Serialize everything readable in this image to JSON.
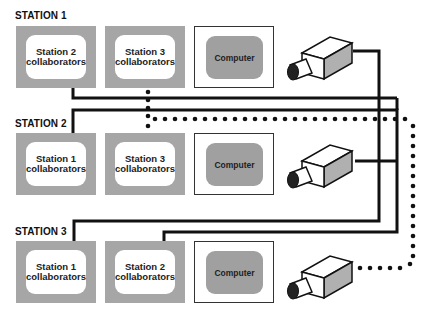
{
  "stations": [
    {
      "label": "STATION 1",
      "panels": [
        {
          "line1": "Station 2",
          "line2": "collaborators"
        },
        {
          "line1": "Station 3",
          "line2": "collaborators"
        }
      ],
      "computer": "Computer",
      "camera": "camera-icon"
    },
    {
      "label": "STATION 2",
      "panels": [
        {
          "line1": "Station 1",
          "line2": "collaborators"
        },
        {
          "line1": "Station 3",
          "line2": "collaborators"
        }
      ],
      "computer": "Computer",
      "camera": "camera-icon"
    },
    {
      "label": "STATION 3",
      "panels": [
        {
          "line1": "Station 1",
          "line2": "collaborators"
        },
        {
          "line1": "Station 2",
          "line2": "collaborators"
        }
      ],
      "computer": "Computer",
      "camera": "camera-icon"
    }
  ],
  "colors": {
    "panel_gray": "#a6a6a6",
    "screen_gray": "#a0a0a0",
    "wire": "#111111"
  }
}
